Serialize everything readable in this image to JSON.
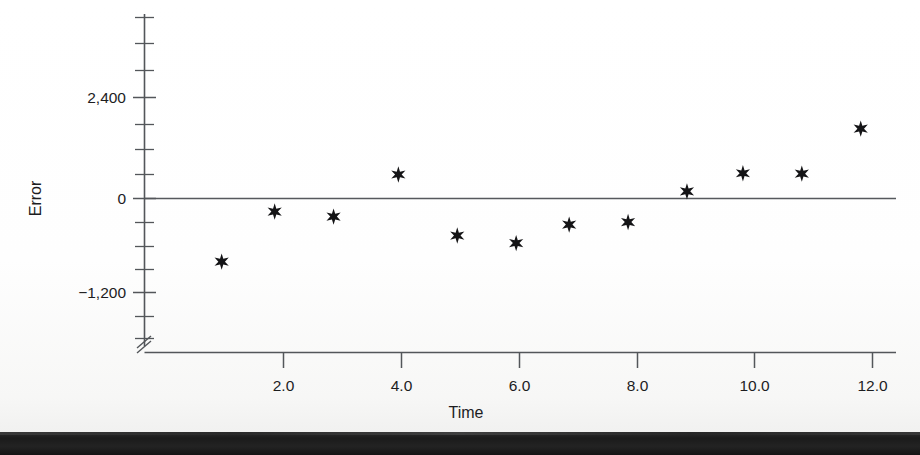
{
  "chart_data": {
    "type": "scatter",
    "title": "",
    "subtitle": "",
    "xlabel": "Time",
    "ylabel": "Error",
    "xlim": [
      0.25,
      12.6
    ],
    "ylim": [
      -1800,
      3100
    ],
    "grid": false,
    "legend": null,
    "marker": "star",
    "marker_color": "#141416",
    "axis_color": "#53565a",
    "y_axis_break": true,
    "x_ticks": [
      2.0,
      4.0,
      6.0,
      8.0,
      10.0,
      12.0
    ],
    "x_tick_labels": [
      "2.0",
      "4.0",
      "6.0",
      "8.0",
      "10.0",
      "12.0"
    ],
    "y_ticks": [
      -1200,
      0,
      2400
    ],
    "y_tick_labels": [
      "−1,200",
      "0",
      "2,400"
    ],
    "y_minor_ticks": [
      -1600,
      -800,
      -400,
      400,
      800,
      1200,
      1600,
      2000,
      2800,
      3200
    ],
    "x": [
      0.95,
      1.85,
      2.85,
      3.95,
      4.95,
      5.95,
      6.85,
      7.85,
      8.85,
      9.8,
      10.8,
      11.8
    ],
    "y": [
      -1500,
      -310,
      -430,
      570,
      -880,
      -1060,
      -620,
      -560,
      170,
      600,
      590,
      1660
    ],
    "points": [
      {
        "x": 0.95,
        "y": -1500
      },
      {
        "x": 1.85,
        "y": -310
      },
      {
        "x": 2.85,
        "y": -430
      },
      {
        "x": 3.95,
        "y": 570
      },
      {
        "x": 4.95,
        "y": -880
      },
      {
        "x": 5.95,
        "y": -1060
      },
      {
        "x": 6.85,
        "y": -620
      },
      {
        "x": 7.85,
        "y": -560
      },
      {
        "x": 8.85,
        "y": 170
      },
      {
        "x": 9.8,
        "y": 600
      },
      {
        "x": 10.8,
        "y": 590
      },
      {
        "x": 11.8,
        "y": 1660
      }
    ]
  },
  "labels": {
    "y_title": "Error",
    "x_title": "Time",
    "y_2400": "2,400",
    "y_0": "0",
    "y_neg1200": "−1,200",
    "x_2": "2.0",
    "x_4": "4.0",
    "x_6": "6.0",
    "x_8": "8.0",
    "x_10": "10.0",
    "x_12": "12.0"
  }
}
